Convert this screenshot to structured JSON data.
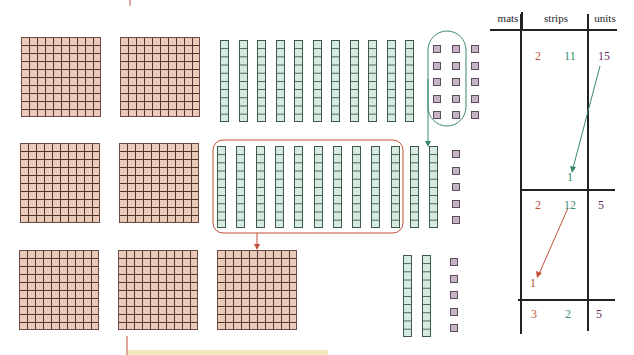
{
  "diagram": {
    "colors": {
      "mat": "#ebc9b8",
      "strip": "#d6eadf",
      "unit": "#c6b4c6",
      "mats_text": "#c0503a",
      "strips_text": "#3a8a6a",
      "units_text": "#6a2a6a",
      "green_arrow": "#3a8a6a",
      "red_arrow": "#c0503a"
    },
    "rows": [
      {
        "mats": 2,
        "strips": 11,
        "units": 15,
        "note": "10 units circled to regroup into 1 strip"
      },
      {
        "mats": 2,
        "strips": 12,
        "units": 5,
        "note": "10 strips boxed to regroup into 1 mat"
      },
      {
        "mats": 3,
        "strips": 2,
        "units": 5,
        "note": "final result"
      }
    ]
  },
  "table": {
    "headers": [
      "mats",
      "strips",
      "units"
    ],
    "row1": [
      "2",
      "11",
      "15"
    ],
    "carry1": "1",
    "row2": [
      "2",
      "12",
      "5"
    ],
    "carry2": "1",
    "row3": [
      "3",
      "2",
      "5"
    ]
  }
}
